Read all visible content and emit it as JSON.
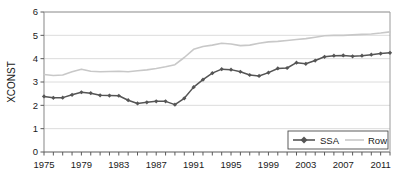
{
  "chart_data": {
    "type": "line",
    "title": "",
    "xlabel": "",
    "ylabel": "XCONST",
    "xlim": [
      1975,
      2012
    ],
    "ylim": [
      0,
      6
    ],
    "ytick_labels": [
      "0",
      "1",
      "2",
      "3",
      "4",
      "5",
      "6"
    ],
    "yticks": [
      0,
      1,
      2,
      3,
      4,
      5,
      6
    ],
    "xtick_labels": [
      "1975",
      "1979",
      "1983",
      "1987",
      "1991",
      "1995",
      "1999",
      "2003",
      "2007",
      "2011"
    ],
    "xticks": [
      1975,
      1979,
      1983,
      1987,
      1991,
      1995,
      1999,
      2003,
      2007,
      2011
    ],
    "x": [
      1975,
      1976,
      1977,
      1978,
      1979,
      1980,
      1981,
      1982,
      1983,
      1984,
      1985,
      1986,
      1987,
      1988,
      1989,
      1990,
      1991,
      1992,
      1993,
      1994,
      1995,
      1996,
      1997,
      1998,
      1999,
      2000,
      2001,
      2002,
      2003,
      2004,
      2005,
      2006,
      2007,
      2008,
      2009,
      2010,
      2011,
      2012
    ],
    "grid": true,
    "grid_axis": "y",
    "legend_position": "bottom-right",
    "series": [
      {
        "name": "SSA",
        "color": "#555555",
        "marker": "diamond",
        "values": [
          2.38,
          2.32,
          2.33,
          2.45,
          2.56,
          2.52,
          2.43,
          2.42,
          2.41,
          2.22,
          2.08,
          2.13,
          2.17,
          2.17,
          2.03,
          2.3,
          2.78,
          3.1,
          3.38,
          3.55,
          3.53,
          3.44,
          3.3,
          3.26,
          3.4,
          3.58,
          3.6,
          3.83,
          3.78,
          3.92,
          4.08,
          4.13,
          4.14,
          4.1,
          4.13,
          4.17,
          4.22,
          4.25
        ]
      },
      {
        "name": "Row",
        "color": "#c8c8c8",
        "marker": "none",
        "values": [
          3.32,
          3.28,
          3.3,
          3.44,
          3.55,
          3.46,
          3.44,
          3.45,
          3.46,
          3.44,
          3.48,
          3.52,
          3.58,
          3.65,
          3.74,
          4.05,
          4.4,
          4.52,
          4.58,
          4.66,
          4.63,
          4.56,
          4.58,
          4.66,
          4.72,
          4.74,
          4.78,
          4.82,
          4.86,
          4.92,
          4.98,
          5.0,
          5.0,
          5.02,
          5.04,
          5.06,
          5.1,
          5.15
        ]
      }
    ]
  },
  "legend": {
    "items": [
      {
        "label": "SSA"
      },
      {
        "label": "Row"
      }
    ]
  },
  "axis": {
    "y_title": "XCONST"
  }
}
